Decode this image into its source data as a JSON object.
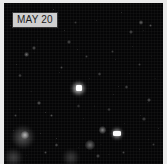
{
  "frame": {
    "name": "sky-survey-frame",
    "caption": "MAY 20",
    "border_color": "#e9e9e9",
    "background_color": "#050505",
    "label_background_color": "#cfcfcf",
    "label_text_color": "#1c1c1c"
  },
  "chart_data": {
    "type": "scatter",
    "title": "MAY 20",
    "subtitle": "",
    "xlabel": "",
    "ylabel": "",
    "xlim": [
      0,
      100
    ],
    "ylim": [
      0,
      100
    ],
    "grid": false,
    "legend": "none",
    "background": "#050505",
    "note": "Values are normalized field coordinates (x,y in percent of frame) and relative brightness 0-1.",
    "sources": [
      {
        "name": "central-bright-source",
        "x": 47,
        "y": 53,
        "r": 4.6,
        "brightness": 1.0,
        "color": "#ffffff"
      },
      {
        "name": "lower-right-knot",
        "x": 71,
        "y": 81,
        "r": 4.0,
        "brightness": 0.95,
        "color": "#f6f6f6"
      },
      {
        "name": "lower-left-diffuse",
        "x": 12,
        "y": 83,
        "r": 7.5,
        "brightness": 0.62,
        "color": "#9a9a9a"
      },
      {
        "name": "lower-left-core",
        "x": 13,
        "y": 82,
        "r": 2.6,
        "brightness": 0.78,
        "color": "#d8d8d8"
      },
      {
        "name": "bottom-left-glow",
        "x": 6,
        "y": 96,
        "r": 6.0,
        "brightness": 0.5,
        "color": "#8a8a8a"
      },
      {
        "name": "bottom-center-glow",
        "x": 42,
        "y": 96,
        "r": 5.5,
        "brightness": 0.46,
        "color": "#868686"
      },
      {
        "name": "bottom-mid-blob",
        "x": 54,
        "y": 88,
        "r": 3.0,
        "brightness": 0.58,
        "color": "#b2b2b2"
      },
      {
        "name": "right-of-center-blob",
        "x": 62,
        "y": 79,
        "r": 2.4,
        "brightness": 0.66,
        "color": "#c6c6c6"
      },
      {
        "name": "star-a",
        "x": 14,
        "y": 32,
        "r": 1.5,
        "brightness": 0.55,
        "color": "#c0c0c0"
      },
      {
        "name": "star-b",
        "x": 19,
        "y": 28,
        "r": 1.2,
        "brightness": 0.48,
        "color": "#b0b0b0"
      },
      {
        "name": "star-c",
        "x": 10,
        "y": 45,
        "r": 1.1,
        "brightness": 0.42,
        "color": "#a8a8a8"
      },
      {
        "name": "star-d",
        "x": 22,
        "y": 62,
        "r": 1.3,
        "brightness": 0.5,
        "color": "#b8b8b8"
      },
      {
        "name": "star-e",
        "x": 30,
        "y": 70,
        "r": 1.1,
        "brightness": 0.44,
        "color": "#ababab"
      },
      {
        "name": "star-f",
        "x": 36,
        "y": 40,
        "r": 1.0,
        "brightness": 0.4,
        "color": "#a0a0a0"
      },
      {
        "name": "star-g",
        "x": 41,
        "y": 24,
        "r": 1.2,
        "brightness": 0.46,
        "color": "#aeaeae"
      },
      {
        "name": "star-h",
        "x": 52,
        "y": 33,
        "r": 1.0,
        "brightness": 0.38,
        "color": "#9c9c9c"
      },
      {
        "name": "star-i",
        "x": 60,
        "y": 44,
        "r": 1.1,
        "brightness": 0.42,
        "color": "#a4a4a4"
      },
      {
        "name": "star-j",
        "x": 68,
        "y": 30,
        "r": 1.0,
        "brightness": 0.36,
        "color": "#989898"
      },
      {
        "name": "star-k",
        "x": 77,
        "y": 52,
        "r": 1.2,
        "brightness": 0.44,
        "color": "#a9a9a9"
      },
      {
        "name": "star-l",
        "x": 85,
        "y": 38,
        "r": 1.0,
        "brightness": 0.36,
        "color": "#969696"
      },
      {
        "name": "star-m",
        "x": 91,
        "y": 60,
        "r": 1.3,
        "brightness": 0.48,
        "color": "#b4b4b4"
      },
      {
        "name": "star-n",
        "x": 88,
        "y": 72,
        "r": 1.1,
        "brightness": 0.42,
        "color": "#a6a6a6"
      },
      {
        "name": "star-o",
        "x": 80,
        "y": 18,
        "r": 1.2,
        "brightness": 0.45,
        "color": "#acacac"
      },
      {
        "name": "star-p",
        "x": 86,
        "y": 12,
        "r": 1.4,
        "brightness": 0.52,
        "color": "#bcbcbc"
      },
      {
        "name": "star-q",
        "x": 92,
        "y": 14,
        "r": 1.1,
        "brightness": 0.44,
        "color": "#a8a8a8"
      },
      {
        "name": "star-r",
        "x": 66,
        "y": 66,
        "r": 1.0,
        "brightness": 0.38,
        "color": "#9e9e9e"
      },
      {
        "name": "star-s",
        "x": 47,
        "y": 64,
        "r": 1.0,
        "brightness": 0.36,
        "color": "#9a9a9a"
      },
      {
        "name": "star-t",
        "x": 33,
        "y": 88,
        "r": 1.2,
        "brightness": 0.46,
        "color": "#adadad"
      },
      {
        "name": "star-u",
        "x": 26,
        "y": 93,
        "r": 1.1,
        "brightness": 0.42,
        "color": "#a5a5a5"
      },
      {
        "name": "star-v",
        "x": 59,
        "y": 95,
        "r": 1.2,
        "brightness": 0.45,
        "color": "#aaaaaa"
      },
      {
        "name": "star-w",
        "x": 75,
        "y": 93,
        "r": 1.1,
        "brightness": 0.4,
        "color": "#a2a2a2"
      },
      {
        "name": "star-x",
        "x": 94,
        "y": 88,
        "r": 1.0,
        "brightness": 0.36,
        "color": "#979797"
      },
      {
        "name": "star-y",
        "x": 7,
        "y": 70,
        "r": 1.0,
        "brightness": 0.38,
        "color": "#9d9d9d"
      },
      {
        "name": "star-z",
        "x": 45,
        "y": 12,
        "r": 1.0,
        "brightness": 0.34,
        "color": "#949494"
      }
    ]
  }
}
